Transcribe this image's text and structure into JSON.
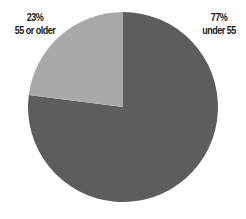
{
  "chart_data": {
    "type": "pie",
    "title": "",
    "categories": [
      "55 or older",
      "under 55"
    ],
    "values": [
      23,
      77
    ],
    "units": "%",
    "slices": [
      {
        "name": "55 or older",
        "value": 23,
        "label_pct": "23%",
        "color": "#a9a9a9"
      },
      {
        "name": "under 55",
        "value": 77,
        "label_pct": "77%",
        "color": "#5d5d5d"
      }
    ],
    "start_angle": "12 o'clock",
    "direction": "counter-clockwise for first slice",
    "legend": "none (direct labels)"
  },
  "labels": {
    "older": {
      "pct": "23%",
      "text": "55 or older"
    },
    "under": {
      "pct": "77%",
      "text": "under 55"
    }
  },
  "geometry": {
    "cx": 123,
    "cy": 107,
    "r": 95
  }
}
